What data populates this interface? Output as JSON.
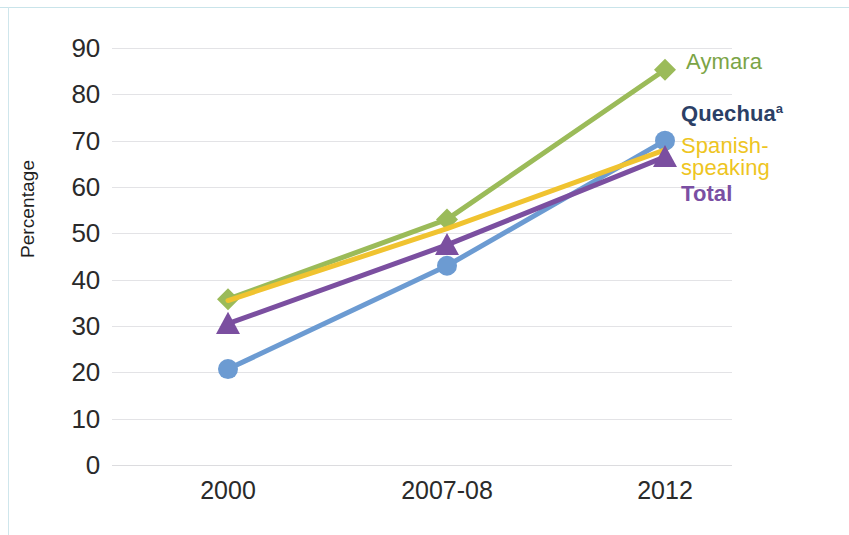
{
  "chart_data": {
    "type": "line",
    "title": "",
    "subtitle": "",
    "xlabel": "",
    "ylabel": "Percentage",
    "categories": [
      "2000",
      "2007-08",
      "2012"
    ],
    "ylim": [
      0,
      90
    ],
    "ytick_step": 10,
    "yticks": [
      "90",
      "80",
      "70",
      "60",
      "50",
      "40",
      "30",
      "20",
      "10",
      "0"
    ],
    "grid": true,
    "legend_position": "right-inline-at-line-ends",
    "series": [
      {
        "name": "Aymara",
        "label": "Aymara",
        "color": "#9BBB59",
        "label_color": "#7ba446",
        "marker": "diamond",
        "bold_label": false,
        "values": [
          35.8,
          53.0,
          85.3
        ]
      },
      {
        "name": "Quechua",
        "label": "Quechua",
        "label_superscript": "a",
        "color": "#6C9BD2",
        "label_color": "#2b3f66",
        "marker": "circle",
        "bold_label": true,
        "values": [
          20.7,
          43.0,
          70.0
        ]
      },
      {
        "name": "Spanish-speaking",
        "label": "Spanish-\nspeaking",
        "color": "#F0C330",
        "label_color": "#eec51f",
        "marker": "none",
        "bold_label": false,
        "values": [
          35.5,
          51.0,
          68.0
        ]
      },
      {
        "name": "Total",
        "label": "Total",
        "color": "#7B4FA0",
        "label_color": "#7a4fa3",
        "marker": "triangle",
        "bold_label": true,
        "values": [
          30.5,
          47.5,
          66.5
        ]
      }
    ]
  }
}
